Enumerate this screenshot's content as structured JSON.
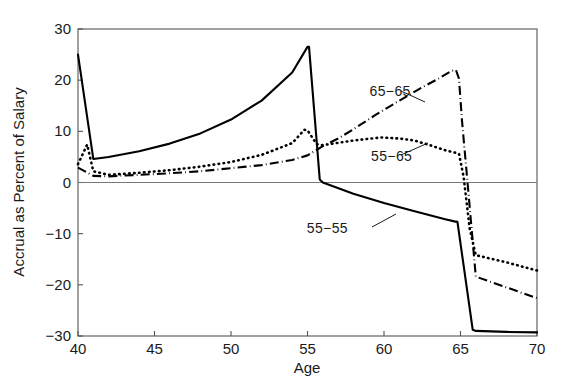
{
  "chart_data": {
    "type": "line",
    "title": "",
    "xlabel": "Age",
    "ylabel": "Accrual as Percent of Salary",
    "xlim": [
      40,
      70
    ],
    "ylim": [
      -30,
      30
    ],
    "xticks": [
      40,
      45,
      50,
      55,
      60,
      65,
      70
    ],
    "xtick_labels": [
      "40",
      "45",
      "50",
      "55",
      "60",
      "65",
      "70"
    ],
    "yticks": [
      -30,
      -20,
      -10,
      0,
      10,
      20,
      30
    ],
    "ytick_labels": [
      "−30",
      "−20",
      "−10",
      "0",
      "10",
      "20",
      "30"
    ],
    "grid": false,
    "legend_position": "inline-annotations",
    "zero_line": 0,
    "series": [
      {
        "name": "55−55",
        "style": "solid",
        "color": "#000000",
        "x": [
          40,
          41,
          42,
          44,
          46,
          48,
          50,
          52,
          54,
          55,
          55.1,
          55.8,
          56,
          58,
          60,
          62,
          64,
          64.6,
          64.8,
          65.8,
          66,
          68,
          70
        ],
        "values": [
          25.0,
          4.6,
          5.0,
          6.1,
          7.6,
          9.6,
          12.3,
          16.0,
          21.5,
          26.5,
          26.5,
          0.6,
          0.0,
          -2.2,
          -4.0,
          -5.6,
          -7.2,
          -7.6,
          -7.7,
          -28.8,
          -29.0,
          -29.2,
          -29.3
        ]
      },
      {
        "name": "55−65",
        "style": "dotted",
        "color": "#000000",
        "x": [
          40,
          40.6,
          41,
          42,
          44,
          46,
          48,
          50,
          52,
          54,
          54.8,
          55,
          55.6,
          56,
          58,
          59.8,
          61,
          62,
          63,
          64,
          64.7,
          64.9,
          65.2,
          65.6,
          66,
          68,
          70
        ],
        "values": [
          3.6,
          7.4,
          2.2,
          1.5,
          1.9,
          2.4,
          3.1,
          4.0,
          5.4,
          7.7,
          10.3,
          10.2,
          7.5,
          7.3,
          8.2,
          8.8,
          8.6,
          8.2,
          7.3,
          6.3,
          5.8,
          5.6,
          1.2,
          -9.0,
          -14.2,
          -15.6,
          -17.2
        ]
      },
      {
        "name": "65−65",
        "style": "dashdot",
        "color": "#000000",
        "x": [
          40,
          41,
          42,
          44,
          46,
          48,
          50,
          51,
          52,
          54,
          55,
          56,
          57,
          58,
          59.5,
          61,
          62.5,
          63.5,
          64.4,
          64.7,
          64.9,
          65.1,
          65.4,
          66,
          68,
          70
        ],
        "values": [
          2.9,
          1.3,
          1.2,
          1.5,
          1.8,
          2.2,
          2.8,
          3.1,
          3.4,
          4.4,
          5.3,
          7.1,
          8.6,
          10.4,
          13.3,
          16.0,
          18.6,
          20.2,
          21.8,
          22.0,
          20.3,
          12.0,
          2.0,
          -18.4,
          -20.5,
          -22.6
        ]
      }
    ],
    "annotations": [
      {
        "text": "65−65",
        "x": 60.4,
        "y": 16.9
      },
      {
        "text": "55−65",
        "x": 60.5,
        "y": 4.2
      },
      {
        "text": "55−55",
        "x": 56.3,
        "y": -9.8
      }
    ]
  },
  "axes": {
    "x_title": "Age",
    "y_title": "Accrual as Percent of Salary"
  }
}
